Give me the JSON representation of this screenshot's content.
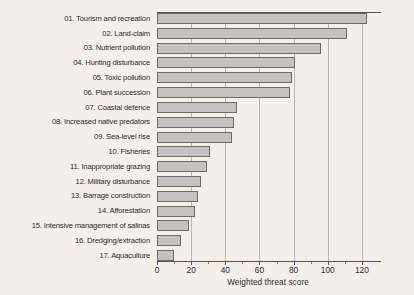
{
  "chart_data": {
    "type": "bar",
    "orientation": "horizontal",
    "title": "",
    "xlabel": "Weighted threat score",
    "ylabel": "",
    "xlim": [
      0,
      130
    ],
    "ylim": null,
    "grid": true,
    "legend": null,
    "xticks": [
      0,
      20,
      40,
      60,
      80,
      100,
      120
    ],
    "xticklabels": [
      "0",
      "20",
      "40",
      "60",
      "80",
      "100",
      "120"
    ],
    "categories": [
      "01. Tourism and recreation",
      "02. Land-claim",
      "03. Nutrient pollution",
      "04. Hunting disturbance",
      "05. Toxic pollution",
      "06. Plant succession",
      "07. Coastal defence",
      "08. Increased native predators",
      "09. Sea-level rise",
      "10. Fisheries",
      "11. Inappropriate grazing",
      "12. Military disturbance",
      "13. Barrage construction",
      "14. Afforestation",
      "15. Intensive management of salinas",
      "16. Dredging/extraction",
      "17. Aquaculture"
    ],
    "values": [
      123,
      111,
      96,
      81,
      79,
      78,
      47,
      45,
      44,
      31,
      29,
      26,
      24,
      22,
      19,
      14,
      10
    ],
    "bar_fill_color": "#c3c2c0",
    "bar_edge_color": "#6d6b68",
    "grid_color": "#b9b6b0",
    "axis_color": "#55524e",
    "background_color": "#f3f0ea"
  }
}
